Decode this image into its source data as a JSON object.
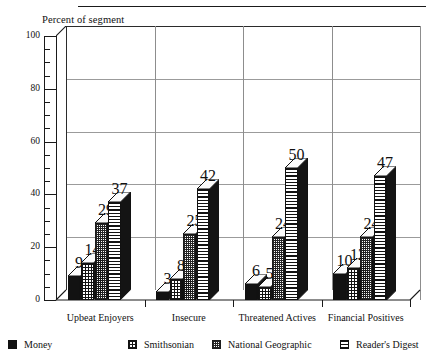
{
  "chart_data": {
    "type": "bar",
    "title": "",
    "ylabel": "Percent of segment",
    "xlabel": "",
    "ylim": [
      0,
      100
    ],
    "ytick_labels": [
      "0",
      "20",
      "40",
      "60",
      "80",
      "100"
    ],
    "ytick_values": [
      0,
      20,
      40,
      60,
      80,
      100
    ],
    "minor_tick_step": 5,
    "grid": "horizontal-and-vertical",
    "legend_position": "bottom",
    "three_d": true,
    "categories": [
      "Upbeat Enjoyers",
      "Insecure",
      "Threatened Actives",
      "Financial Positives"
    ],
    "series": [
      {
        "name": "Money",
        "pattern": "solid-black",
        "values": [
          9,
          3,
          6,
          10
        ]
      },
      {
        "name": "Smithsonian",
        "pattern": "grid-crosshatch",
        "values": [
          14,
          8,
          5,
          12
        ]
      },
      {
        "name": "National Geographic",
        "pattern": "dotted-stipple",
        "values": [
          29,
          25,
          24,
          24
        ]
      },
      {
        "name": "Reader's Digest",
        "pattern": "horizontal-lines",
        "values": [
          37,
          42,
          50,
          47
        ]
      }
    ]
  },
  "legend": {
    "items": [
      {
        "label": "Money"
      },
      {
        "label": "Smithsonian"
      },
      {
        "label": "National Geographic"
      },
      {
        "label": "Reader's Digest"
      }
    ]
  }
}
